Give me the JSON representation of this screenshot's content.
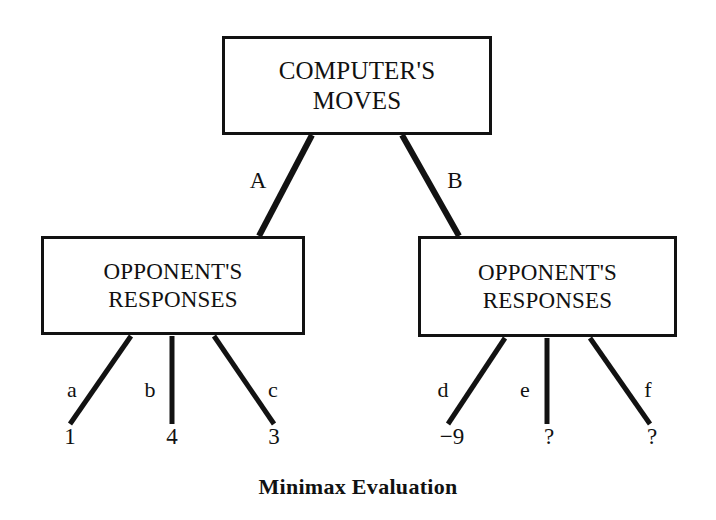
{
  "caption": "Minimax Evaluation",
  "nodes": {
    "root": {
      "line1": "COMPUTER'S",
      "line2": "MOVES"
    },
    "left": {
      "line1": "OPPONENT'S",
      "line2": "RESPONSES"
    },
    "right": {
      "line1": "OPPONENT'S",
      "line2": "RESPONSES"
    }
  },
  "edges": {
    "root_branches": [
      {
        "label": "A",
        "x": 258,
        "y": 180
      },
      {
        "label": "B",
        "x": 455,
        "y": 180
      }
    ],
    "left_branches": [
      {
        "label": "a",
        "x": 72,
        "y": 390
      },
      {
        "label": "b",
        "x": 150,
        "y": 390
      },
      {
        "label": "c",
        "x": 273,
        "y": 390
      }
    ],
    "right_branches": [
      {
        "label": "d",
        "x": 443,
        "y": 390
      },
      {
        "label": "e",
        "x": 525,
        "y": 390
      },
      {
        "label": "f",
        "x": 648,
        "y": 390
      }
    ]
  },
  "leaves": [
    {
      "value": "1",
      "x": 70,
      "y": 436
    },
    {
      "value": "4",
      "x": 172,
      "y": 436
    },
    {
      "value": "3",
      "x": 274,
      "y": 436
    },
    {
      "value": "−9",
      "x": 452,
      "y": 436
    },
    {
      "value": "?",
      "x": 549,
      "y": 436
    },
    {
      "value": "?",
      "x": 652,
      "y": 436
    }
  ],
  "chart_data": {
    "type": "diagram",
    "title": "Minimax Evaluation",
    "tree": {
      "label": "COMPUTER'S MOVES",
      "children": [
        {
          "edge": "A",
          "label": "OPPONENT'S RESPONSES",
          "children": [
            {
              "edge": "a",
              "value": "1"
            },
            {
              "edge": "b",
              "value": "4"
            },
            {
              "edge": "c",
              "value": "3"
            }
          ]
        },
        {
          "edge": "B",
          "label": "OPPONENT'S RESPONSES",
          "children": [
            {
              "edge": "d",
              "value": "−9"
            },
            {
              "edge": "e",
              "value": "?"
            },
            {
              "edge": "f",
              "value": "?"
            }
          ]
        }
      ]
    }
  },
  "colors": {
    "ink": "#121212",
    "background": "#ffffff"
  }
}
